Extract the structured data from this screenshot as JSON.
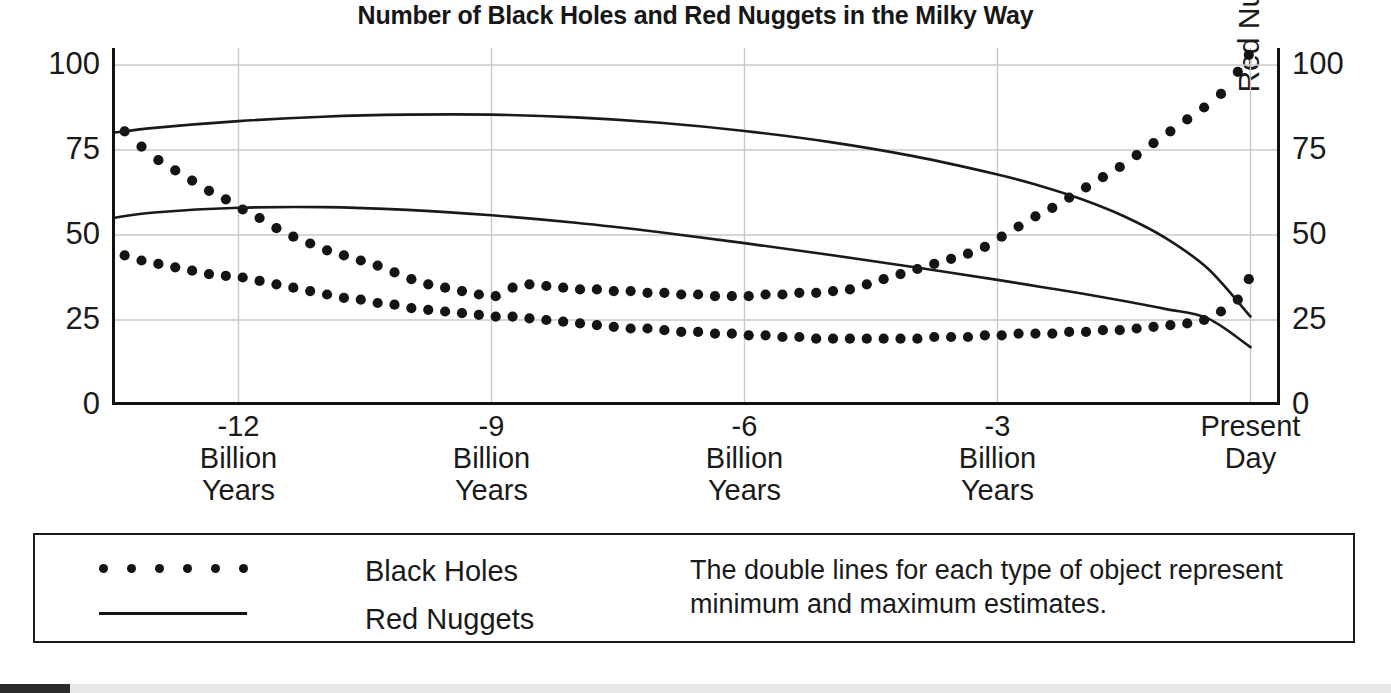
{
  "chart_data": {
    "type": "line",
    "title": "Number of Black Holes and Red Nuggets in the Milky Way",
    "xlabel": "",
    "ylabel": "Black Holes (Million)",
    "ylabel_right": "Red Nuggets",
    "xlim": [
      -13.5,
      0.35
    ],
    "ylim": [
      0,
      105
    ],
    "y_ticks": [
      0,
      25,
      50,
      75,
      100
    ],
    "y_ticks_right": [
      0,
      25,
      50,
      75,
      100
    ],
    "x_ticks": [
      -12,
      -9,
      -6,
      -3,
      0
    ],
    "x_tick_labels": [
      {
        "line1": "-12",
        "line2": "Billion",
        "line3": "Years"
      },
      {
        "line1": "-9",
        "line2": "Billion",
        "line3": "Years"
      },
      {
        "line1": "-6",
        "line2": "Billion",
        "line3": "Years"
      },
      {
        "line1": "-3",
        "line2": "Billion",
        "line3": "Years"
      },
      {
        "line1": "Present",
        "line2": "Day",
        "line3": ""
      }
    ],
    "grid": true,
    "legend_position": "below-plot",
    "annotation": "The double lines for each type of object represent minimum and maximum estimates.",
    "series": [
      {
        "name": "Black Holes (maximum estimate)",
        "style": "dotted",
        "marker": "circle",
        "axis": "left",
        "x": [
          -13.35,
          -13.15,
          -12.95,
          -12.75,
          -12.55,
          -12.35,
          -12.15,
          -11.95,
          -11.75,
          -11.55,
          -11.35,
          -11.15,
          -10.95,
          -10.75,
          -10.55,
          -10.35,
          -10.15,
          -9.95,
          -9.75,
          -9.55,
          -9.35,
          -9.15,
          -8.95,
          -8.75,
          -8.55,
          -8.35,
          -8.15,
          -7.95,
          -7.75,
          -7.55,
          -7.35,
          -7.15,
          -6.95,
          -6.75,
          -6.55,
          -6.35,
          -6.15,
          -5.95,
          -5.75,
          -5.55,
          -5.35,
          -5.15,
          -4.95,
          -4.75,
          -4.55,
          -4.35,
          -4.15,
          -3.95,
          -3.75,
          -3.55,
          -3.35,
          -3.15,
          -2.95,
          -2.75,
          -2.55,
          -2.35,
          -2.15,
          -1.95,
          -1.75,
          -1.55,
          -1.35,
          -1.15,
          -0.95,
          -0.75,
          -0.55,
          -0.35,
          -0.15,
          -0.02
        ],
        "y": [
          80.5,
          76.0,
          72.0,
          69.0,
          66.0,
          63.0,
          60.5,
          57.5,
          55.0,
          52.0,
          49.5,
          47.5,
          45.5,
          44.0,
          42.5,
          41.0,
          39.0,
          37.0,
          35.5,
          34.5,
          33.5,
          32.5,
          32.0,
          34.5,
          35.5,
          35.0,
          34.5,
          34.0,
          34.0,
          33.5,
          33.5,
          33.0,
          33.0,
          32.5,
          32.5,
          32.0,
          32.0,
          32.0,
          32.5,
          32.5,
          33.0,
          33.0,
          33.5,
          34.0,
          35.5,
          37.0,
          38.5,
          40.0,
          41.5,
          43.0,
          44.5,
          46.5,
          49.5,
          52.5,
          55.5,
          58.0,
          61.0,
          64.0,
          67.0,
          70.0,
          73.5,
          77.0,
          80.5,
          84.0,
          87.5,
          91.5,
          98.0,
          103.0
        ]
      },
      {
        "name": "Black Holes (minimum estimate)",
        "style": "dotted",
        "marker": "circle",
        "axis": "left",
        "x": [
          -13.35,
          -13.15,
          -12.95,
          -12.75,
          -12.55,
          -12.35,
          -12.15,
          -11.95,
          -11.75,
          -11.55,
          -11.35,
          -11.15,
          -10.95,
          -10.75,
          -10.55,
          -10.35,
          -10.15,
          -9.95,
          -9.75,
          -9.55,
          -9.35,
          -9.15,
          -8.95,
          -8.75,
          -8.55,
          -8.35,
          -8.15,
          -7.95,
          -7.75,
          -7.55,
          -7.35,
          -7.15,
          -6.95,
          -6.75,
          -6.55,
          -6.35,
          -6.15,
          -5.95,
          -5.75,
          -5.55,
          -5.35,
          -5.15,
          -4.95,
          -4.75,
          -4.55,
          -4.35,
          -4.15,
          -3.95,
          -3.75,
          -3.55,
          -3.35,
          -3.15,
          -2.95,
          -2.75,
          -2.55,
          -2.35,
          -2.15,
          -1.95,
          -1.75,
          -1.55,
          -1.35,
          -1.15,
          -0.95,
          -0.75,
          -0.55,
          -0.35,
          -0.15,
          -0.02
        ],
        "y": [
          44.0,
          42.5,
          41.5,
          40.5,
          39.5,
          38.5,
          38.0,
          37.5,
          36.5,
          35.5,
          34.5,
          33.5,
          32.5,
          31.5,
          31.0,
          30.0,
          29.5,
          28.5,
          28.0,
          27.5,
          27.0,
          26.5,
          26.0,
          26.0,
          25.5,
          25.0,
          24.5,
          24.0,
          23.5,
          23.0,
          22.5,
          22.5,
          22.0,
          21.5,
          21.5,
          21.0,
          21.0,
          20.5,
          20.5,
          20.0,
          20.0,
          19.5,
          19.5,
          19.5,
          19.5,
          19.5,
          19.5,
          19.5,
          20.0,
          20.0,
          20.0,
          20.5,
          20.5,
          21.0,
          21.0,
          21.0,
          21.5,
          21.5,
          22.0,
          22.0,
          22.5,
          23.0,
          23.5,
          24.0,
          25.0,
          27.5,
          31.0,
          37.0
        ]
      },
      {
        "name": "Red Nuggets (maximum estimate)",
        "style": "solid",
        "axis": "right",
        "x": [
          -13.5,
          -13.0,
          -12.0,
          -11.0,
          -10.0,
          -9.0,
          -8.0,
          -7.0,
          -6.0,
          -5.0,
          -4.0,
          -3.0,
          -2.5,
          -2.0,
          -1.5,
          -1.0,
          -0.5,
          0.0
        ],
        "y": [
          80.0,
          81.5,
          83.5,
          84.8,
          85.4,
          85.4,
          84.6,
          83.0,
          80.6,
          77.4,
          73.2,
          67.8,
          64.5,
          60.5,
          55.5,
          49.0,
          40.0,
          26.0
        ]
      },
      {
        "name": "Red Nuggets (minimum estimate)",
        "style": "solid",
        "axis": "right",
        "x": [
          -13.5,
          -13.0,
          -12.0,
          -11.0,
          -10.0,
          -9.0,
          -8.0,
          -7.0,
          -6.0,
          -5.0,
          -4.0,
          -3.0,
          -2.5,
          -2.0,
          -1.5,
          -1.0,
          -0.5,
          0.0
        ],
        "y": [
          55.0,
          56.6,
          58.0,
          58.2,
          57.4,
          55.8,
          53.6,
          50.8,
          47.6,
          44.2,
          40.6,
          36.8,
          34.8,
          32.8,
          30.6,
          28.2,
          25.4,
          17.0
        ]
      }
    ]
  },
  "legend": {
    "black_holes_label": "Black Holes",
    "red_nuggets_label": "Red Nuggets",
    "note": "The double lines for each type of object represent minimum and maximum estimates."
  },
  "colors": {
    "ink": "#1a1a1a",
    "grid": "#c9c9c9",
    "axis": "#111111",
    "marker": "#141414",
    "background": "#ffffff"
  }
}
